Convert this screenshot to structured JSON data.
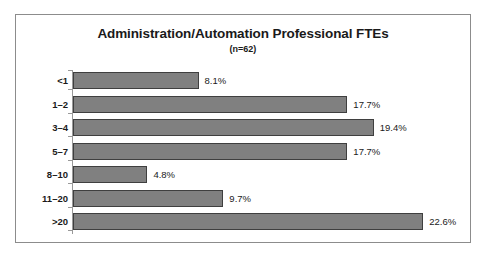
{
  "chart_data": {
    "type": "bar",
    "orientation": "horizontal",
    "title": "Administration/Automation Professional FTEs",
    "subtitle": "(n=62)",
    "xlabel": "",
    "ylabel": "",
    "xlim": [
      0,
      25
    ],
    "grid": false,
    "legend": null,
    "categories": [
      "<1",
      "1–2",
      "3–4",
      "5–7",
      "8–10",
      "11–20",
      ">20"
    ],
    "values": [
      8.1,
      17.7,
      19.4,
      17.7,
      4.8,
      9.7,
      22.6
    ],
    "value_labels": [
      "8.1%",
      "17.7%",
      "19.4%",
      "17.7%",
      "4.8%",
      "9.7%",
      "22.6%"
    ],
    "series": [
      {
        "name": "Percent of respondents",
        "values": [
          8.1,
          17.7,
          19.4,
          17.7,
          4.8,
          9.7,
          22.6
        ]
      }
    ]
  },
  "style": {
    "bar_fill": "#808080",
    "bar_border": "#3f3f3f",
    "frame_border": "#8c8c8c",
    "axis_color": "#999999",
    "text_color": "#1a1a1a",
    "background": "#ffffff"
  }
}
